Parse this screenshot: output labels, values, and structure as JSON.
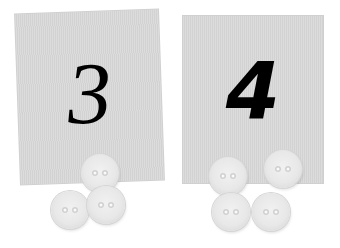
{
  "cards": [
    {
      "number": "3",
      "buttons": 3
    },
    {
      "number": "4",
      "buttons": 4
    }
  ],
  "colors": {
    "card": "#d9d9d9",
    "button": "#e8e8e8",
    "digit": "#000000"
  }
}
